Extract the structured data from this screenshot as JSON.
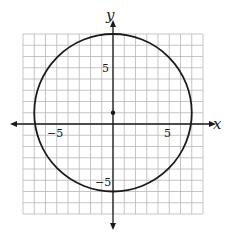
{
  "diagram": {
    "type": "coordinate-plane",
    "x_axis_label": "x",
    "y_axis_label": "y",
    "tick_labels": {
      "x_neg": "−5",
      "x_pos": "5",
      "y_pos": "5",
      "y_neg": "−5"
    },
    "grid": {
      "xmin": -8,
      "xmax": 8,
      "ymin": -8,
      "ymax": 8,
      "step": 1
    },
    "circle": {
      "center": [
        0,
        1
      ],
      "radius": 7
    },
    "center_point": [
      0,
      1
    ],
    "colors": {
      "grid": "#b8b8b8",
      "axis": "#1a1a1a",
      "curve": "#1a1a1a",
      "background": "#ffffff"
    }
  }
}
